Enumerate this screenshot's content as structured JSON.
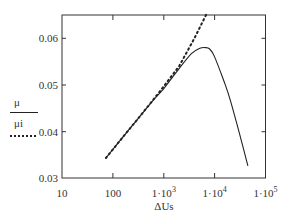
{
  "chart_data": {
    "type": "line",
    "title": "",
    "xlabel": "ΔUs",
    "ylabel": "",
    "xscale": "log",
    "xlim": [
      10,
      100000
    ],
    "ylim": [
      0.03,
      0.065
    ],
    "x_ticks": [
      "10",
      "100",
      "1·10³",
      "1·10⁴",
      "1·10⁵"
    ],
    "y_ticks": [
      "0.03",
      "0.04",
      "0.05",
      "0.06"
    ],
    "grid": false,
    "legend_position": "left",
    "series": [
      {
        "name": "μ",
        "style": "solid",
        "x": [
          73,
          150,
          300,
          600,
          1000,
          2000,
          3500,
          5000,
          6500,
          8000,
          10000,
          15000,
          20000,
          30000,
          45000
        ],
        "y": [
          0.0343,
          0.0385,
          0.0425,
          0.0465,
          0.0492,
          0.0535,
          0.0567,
          0.0578,
          0.058,
          0.0577,
          0.056,
          0.051,
          0.047,
          0.04,
          0.0326
        ]
      },
      {
        "name": "μi",
        "style": "dotted",
        "x": [
          73,
          150,
          300,
          600,
          1000,
          2000,
          4000,
          7000
        ],
        "y": [
          0.0343,
          0.0385,
          0.0425,
          0.0466,
          0.0497,
          0.054,
          0.06,
          0.0653
        ]
      }
    ]
  },
  "legend": {
    "series1_label": "μ",
    "series2_label": "μi"
  },
  "axes": {
    "x_title": "ΔUs",
    "x_tick_labels": [
      {
        "base": "10",
        "exp": ""
      },
      {
        "base": "100",
        "exp": ""
      },
      {
        "base": "1·10",
        "exp": "3"
      },
      {
        "base": "1·10",
        "exp": "4"
      },
      {
        "base": "1·10",
        "exp": "5"
      }
    ],
    "y_tick_labels": [
      "0.03",
      "0.04",
      "0.05",
      "0.06"
    ]
  }
}
